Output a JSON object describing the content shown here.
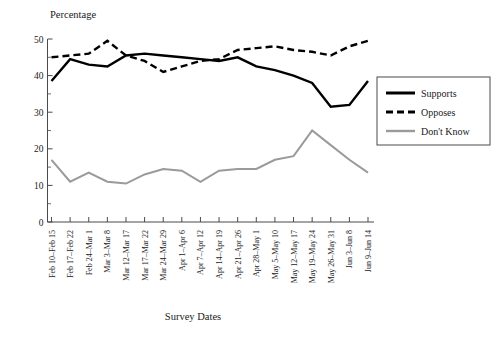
{
  "chart_data": {
    "type": "line",
    "title": "",
    "ylabel": "Percentage",
    "xlabel": "Survey Dates",
    "ylim": [
      0,
      50
    ],
    "grid": false,
    "legend_position": "right",
    "ytick_labels": [
      "0",
      "10",
      "20",
      "30",
      "40",
      "50"
    ],
    "ytick_values": [
      0,
      10,
      20,
      30,
      40,
      50
    ],
    "yminor_values": [
      5,
      15,
      25,
      35,
      45
    ],
    "categories": [
      "Feb 10–Feb 15",
      "Feb 17–Feb 22",
      "Feb 24–Mar 1",
      "Mar 3–Mar 8",
      "Mar 12–Mar 17",
      "Mar 17–Mar 22",
      "Mar 24–Mar 29",
      "Apr 1–Apr 6",
      "Apr 7–Apr 12",
      "Apr 14–Apr 19",
      "Apr 21–Apr 26",
      "Apr 28–May 1",
      "May 5–May 10",
      "May 12–May 17",
      "May 19–May 24",
      "May 26–May 31",
      "Jun 3–Jun 8",
      "Jun 9–Jun 14"
    ],
    "series": [
      {
        "name": "Supports",
        "style": "solid",
        "color": "#000000",
        "values": [
          38.5,
          44.5,
          43.0,
          42.5,
          45.5,
          46.0,
          45.5,
          45.0,
          44.5,
          44.0,
          45.0,
          42.5,
          41.5,
          40.0,
          38.0,
          31.5,
          32.0,
          38.5
        ]
      },
      {
        "name": "Opposes",
        "style": "dashed",
        "color": "#000000",
        "values": [
          45.0,
          45.5,
          46.0,
          49.5,
          45.5,
          44.0,
          41.0,
          42.5,
          44.0,
          44.5,
          47.0,
          47.5,
          48.0,
          47.0,
          46.5,
          45.5,
          48.0,
          49.5
        ]
      },
      {
        "name": "Don't Know",
        "style": "solid",
        "color": "#9a9a9a",
        "values": [
          17.0,
          11.0,
          13.5,
          11.0,
          10.5,
          13.0,
          14.5,
          14.0,
          11.0,
          14.0,
          14.5,
          14.5,
          17.0,
          18.0,
          25.0,
          21.0,
          17.0,
          13.5
        ]
      }
    ]
  },
  "legend": {
    "items": [
      {
        "label": "Supports"
      },
      {
        "label": "Opposes"
      },
      {
        "label": "Don't Know"
      }
    ]
  }
}
